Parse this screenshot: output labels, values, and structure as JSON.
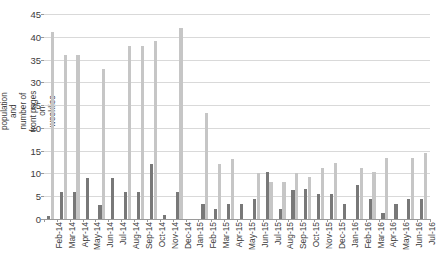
{
  "chart_data": {
    "type": "bar",
    "title": "",
    "subtitle": "",
    "xlabel": "",
    "ylabel": "Percentage of surveyed population and number of front pages on weeklies",
    "ylim": [
      0,
      45
    ],
    "ytick_step": 5,
    "yticks": [
      0,
      5,
      10,
      15,
      20,
      25,
      30,
      35,
      40,
      45
    ],
    "grid": true,
    "grid_axis": "y",
    "legend": null,
    "legend_position": "none",
    "orientation": "vertical",
    "bar_grouping": "grouped",
    "categories": [
      "Feb-14",
      "Mar-14",
      "Apr-14",
      "May-14",
      "Jun-14",
      "Jul-14",
      "Aug-14",
      "Sep-14",
      "Oct-14",
      "Nov-14",
      "Dec-14",
      "Jan-15",
      "Feb-15",
      "Mar-15",
      "Apr-15",
      "May-15",
      "Jun-15",
      "Jul-15",
      "Aug-15",
      "Sep-15",
      "Oct-15",
      "Nov-15",
      "Dec-15",
      "Jan-16",
      "Feb-16",
      "Mar-16",
      "Apr-16",
      "May-16",
      "Jun-16",
      "Jul-16"
    ],
    "series": [
      {
        "name": "Number of front pages on weeklies",
        "color": "#787878",
        "values": [
          0.6,
          6.0,
          6.0,
          9.0,
          3.0,
          9.0,
          6.0,
          6.0,
          12.0,
          0.8,
          6.0,
          0.0,
          3.2,
          2.3,
          3.2,
          3.3,
          4.3,
          10.3,
          2.3,
          6.4,
          6.5,
          5.4,
          5.4,
          3.3,
          7.4,
          4.4,
          1.4,
          3.4,
          4.5,
          4.5
        ]
      },
      {
        "name": "Percentage of surveyed population",
        "color": "#c6c6c6",
        "values": [
          41.0,
          36.0,
          36.0,
          0.0,
          33.0,
          0.0,
          38.0,
          38.0,
          39.0,
          0.0,
          42.0,
          0.0,
          23.2,
          12.1,
          13.2,
          0.0,
          10.2,
          8.2,
          8.2,
          10.2,
          9.3,
          11.2,
          12.2,
          0.0,
          11.3,
          10.3,
          13.3,
          0.0,
          13.3,
          14.5
        ]
      }
    ]
  },
  "axis": {
    "y_title": "Percentage of surveyed population and number of front pages on weeklies",
    "y_tick_labels": [
      "0",
      "5",
      "10",
      "15",
      "20",
      "25",
      "30",
      "35",
      "40",
      "45"
    ]
  },
  "colors": {
    "dark_series": "#787878",
    "light_series": "#c6c6c6",
    "gridline": "#d9d9d9",
    "axis": "#9a9a9a",
    "text": "#3b3b3b",
    "background": "#ffffff"
  }
}
